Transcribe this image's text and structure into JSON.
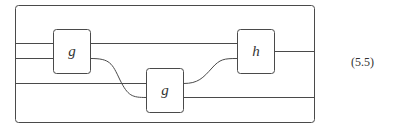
{
  "diagram": {
    "type": "string-diagram",
    "frame": {
      "label": "outer-box"
    },
    "boxes": [
      {
        "id": "g1",
        "label": "g"
      },
      {
        "id": "g2",
        "label": "g"
      },
      {
        "id": "h",
        "label": "h"
      }
    ],
    "wires": [
      {
        "from": "input-1",
        "to": "g1"
      },
      {
        "from": "input-2",
        "to": "g1"
      },
      {
        "from": "input-3",
        "to": "g2"
      },
      {
        "from": "g1",
        "to": "h"
      },
      {
        "from": "g1",
        "to": "g2"
      },
      {
        "from": "g2",
        "to": "h"
      },
      {
        "from": "g2",
        "to": "output-2"
      },
      {
        "from": "h",
        "to": "output-1"
      }
    ],
    "equation_number": "(5.5)"
  },
  "colors": {
    "stroke": "#4a4a4a",
    "background": "#ffffff"
  }
}
